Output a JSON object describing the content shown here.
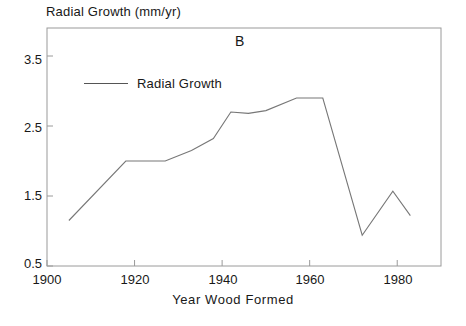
{
  "panel": {
    "label": "B"
  },
  "legend": {
    "entries": [
      {
        "label": "Radial Growth",
        "marker": "line",
        "color": "#777777"
      }
    ],
    "position": "upper-left-inside"
  },
  "chart_data": {
    "type": "line",
    "title": "",
    "subtitle": "",
    "panel_label": "B",
    "xlabel": "Year Wood Formed",
    "ylabel": "Radial Growth (mm/yr)",
    "xlim": [
      1900,
      1990
    ],
    "ylim": [
      0.5,
      3.9
    ],
    "xticks": [
      1900,
      1920,
      1940,
      1960,
      1980
    ],
    "xtick_labels": [
      "1900",
      "1920",
      "1940",
      "1960",
      "1980"
    ],
    "yticks": [
      0.5,
      1.5,
      2.5,
      3.5
    ],
    "ytick_labels": [
      "0.5",
      "1.5",
      "2.5",
      "3.5"
    ],
    "grid": false,
    "legend_position": "upper-left-inside",
    "series": [
      {
        "name": "Radial Growth",
        "color": "#777777",
        "x": [
          1905,
          1918,
          1927,
          1933,
          1938,
          1942,
          1946,
          1950,
          1957,
          1963,
          1972,
          1979,
          1983
        ],
        "values": [
          1.15,
          2.0,
          2.0,
          2.15,
          2.32,
          2.7,
          2.68,
          2.72,
          2.9,
          2.9,
          0.94,
          1.57,
          1.22
        ]
      }
    ]
  },
  "colors": {
    "axis": "#9a9a9a",
    "line": "#777777",
    "text": "#181818",
    "background": "#ffffff"
  }
}
